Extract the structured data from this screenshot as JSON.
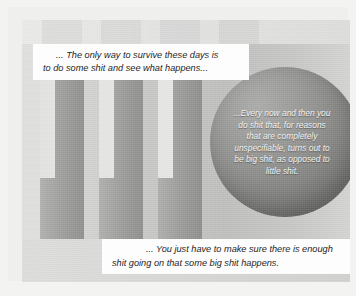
{
  "figure": {
    "kind": "grayscale-abstract-illustration-with-quote-callouts",
    "background_description": "Vertical gray bars with light inner columns and dark caps over a graded gray field",
    "sphere_description": "Large shaded gray sphere on the right side"
  },
  "callouts": [
    {
      "id": "top-quote",
      "style": "white-box",
      "lines": [
        "... The only way to survive these days is",
        "to do some shit and see what happens..."
      ]
    },
    {
      "id": "sphere-quote",
      "style": "white-text-on-sphere",
      "lines": [
        "...Every now and then you",
        "do shit that, for reasons",
        "that are completely",
        "unspecifiable, turns out to",
        "be big shit, as opposed to",
        "little shit."
      ]
    },
    {
      "id": "bottom-quote",
      "style": "white-box",
      "lines": [
        "... You just have to make sure there is enough",
        "shit going on that some big shit happens."
      ]
    }
  ],
  "colors": {
    "page_background": "#f3f3f1",
    "frame": "#efefed",
    "plate_background": "#c9c9c7",
    "callout_box": "#fdfdfd",
    "callout_text": "#1d1d1d",
    "sphere_text": "#f4f4f2",
    "bar_light": "#e4e4e2",
    "bar_mid": "#b6b6b4",
    "bar_dark": "#8d8d8b",
    "bar_cap": "#9b9b99",
    "sphere_light": "#a9a9a7",
    "sphere_dark": "#585856"
  },
  "background_art": {
    "top_caps": [
      {
        "x": 34,
        "y": 13,
        "w": 40,
        "h": 11
      },
      {
        "x": 93,
        "y": 13,
        "w": 40,
        "h": 11
      },
      {
        "x": 152,
        "y": 13,
        "w": 40,
        "h": 11
      },
      {
        "x": 211,
        "y": 13,
        "w": 40,
        "h": 11
      }
    ],
    "dark_caps": [
      {
        "x": 18,
        "y": 60,
        "w": 16,
        "h": 13
      },
      {
        "x": 77,
        "y": 60,
        "w": 16,
        "h": 13
      },
      {
        "x": 136,
        "y": 60,
        "w": 16,
        "h": 13
      }
    ],
    "light_columns": [
      {
        "x": 18,
        "y": 60,
        "w": 16,
        "h": 112
      },
      {
        "x": 77,
        "y": 60,
        "w": 16,
        "h": 112
      },
      {
        "x": 136,
        "y": 60,
        "w": 16,
        "h": 112
      }
    ],
    "dark_columns": [
      {
        "x": 18,
        "y": 60,
        "w": 42,
        "h": 160
      },
      {
        "x": 77,
        "y": 60,
        "w": 42,
        "h": 160
      },
      {
        "x": 136,
        "y": 60,
        "w": 42,
        "h": 160
      }
    ],
    "sphere": {
      "cx": 263,
      "cy": 122,
      "r": 75
    }
  }
}
